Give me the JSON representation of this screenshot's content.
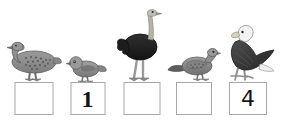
{
  "worksheet": {
    "title": "Order the birds by size",
    "background_color": "#ffffff",
    "box_border_color": "#a8a8a8",
    "ink_color": "#141414"
  },
  "items": [
    {
      "index": 1,
      "bird": "goose",
      "bird_icon": "goose-icon",
      "bird_description": "speckled grey goose standing",
      "box_value": "",
      "box_filled": false
    },
    {
      "index": 2,
      "bird": "sparrow",
      "bird_icon": "sparrow-icon",
      "bird_description": "small grey songbird",
      "box_value": "1",
      "box_filled": true
    },
    {
      "index": 3,
      "bird": "ostrich",
      "bird_icon": "ostrich-icon",
      "bird_description": "tall black ostrich with long pale neck",
      "box_value": "",
      "box_filled": false
    },
    {
      "index": 4,
      "bird": "pigeon",
      "bird_icon": "pigeon-icon",
      "bird_description": "grey pigeon standing",
      "box_value": "",
      "box_filled": false
    },
    {
      "index": 5,
      "bird": "eagle",
      "bird_icon": "eagle-icon",
      "bird_description": "bald eagle with white head perched",
      "box_value": "4",
      "box_filled": true
    }
  ]
}
